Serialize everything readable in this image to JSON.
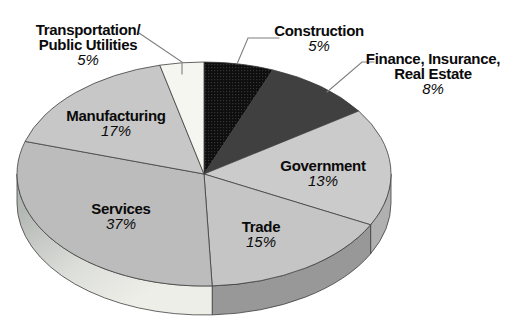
{
  "background_color": "#ffffff",
  "line_color": "#3f3f3f",
  "leader_color": "#7f7f7f",
  "text_color": "#0a0a0a",
  "chart_data": {
    "type": "pie",
    "style": "3d-ellipse",
    "unit": "%",
    "title": "",
    "legend": "none (direct slice labels, three with leader lines)",
    "direction": "clockwise",
    "start": "12-oclock",
    "categories": [
      "Construction",
      "Finance, Insurance, Real Estate",
      "Government",
      "Trade",
      "Services",
      "Manufacturing",
      "Transportation/Public Utilities"
    ],
    "values": [
      5,
      8,
      13,
      15,
      37,
      17,
      5
    ],
    "layout": {
      "cx": 204,
      "cy": 174,
      "rx": 187,
      "ry": 112,
      "depth": 29,
      "wall_visible_cum_range": [
        25,
        75
      ],
      "note_drawn_boundaries": "cumulative % positions of slice edges as drawn in source image"
    },
    "services_wall_gradient": {
      "x1": 30,
      "y1": 205,
      "x2": 110,
      "y2": 320,
      "stops": [
        [
          "0%",
          "#b4b8b4"
        ],
        [
          "55%",
          "#dcdeda"
        ],
        [
          "100%",
          "#eeeee8"
        ]
      ]
    },
    "construction_texture": {
      "base": "#0e0e0e",
      "dot": "#343434"
    },
    "slices": [
      {
        "id": "construction",
        "label": "Construction",
        "value": 5,
        "pct_label": "5%",
        "label_lines": [
          "Construction"
        ],
        "label_x": 319,
        "label_y": 23,
        "top_color": "pattern:construction",
        "side_color": "#8a8a8a",
        "drawn": [
          0,
          6.0
        ],
        "leader": [
          [
            279,
            38
          ],
          [
            248,
            38
          ],
          [
            237,
            64
          ]
        ]
      },
      {
        "id": "finance-insurance-real-estate",
        "label": "Finance, Insurance, Real Estate",
        "value": 8,
        "pct_label": "8%",
        "label_lines": [
          "Finance, Insurance,",
          "Real Estate"
        ],
        "label_x": 433,
        "label_y": 51,
        "top_color": "#404040",
        "side_color": "#2e2e2e",
        "drawn": [
          6.0,
          15.5
        ],
        "leader": [
          [
            374,
            62
          ],
          [
            362,
            62
          ],
          [
            327,
            92
          ]
        ]
      },
      {
        "id": "government",
        "label": "Government",
        "value": 13,
        "pct_label": "13%",
        "label_lines": [
          "Government"
        ],
        "label_x": 323,
        "label_y": 158,
        "top_color": "#cbcbcb",
        "side_color": "#b0b0b0",
        "drawn": [
          15.5,
          32.5
        ],
        "leader": null
      },
      {
        "id": "trade",
        "label": "Trade",
        "value": 15,
        "pct_label": "15%",
        "label_lines": [
          "Trade"
        ],
        "label_x": 261,
        "label_y": 219,
        "top_color": "#c5c5c5",
        "side_color": "#989898",
        "drawn": [
          32.5,
          49.3
        ],
        "leader": null
      },
      {
        "id": "services",
        "label": "Services",
        "value": 37,
        "pct_label": "37%",
        "label_lines": [
          "Services"
        ],
        "label_x": 121,
        "label_y": 201,
        "top_color": "#bcbcbc",
        "side_color": "gradient:services-wall",
        "drawn": [
          49.3,
          79.7
        ],
        "leader": null
      },
      {
        "id": "manufacturing",
        "label": "Manufacturing",
        "value": 17,
        "pct_label": "17%",
        "label_lines": [
          "Manufacturing"
        ],
        "label_x": 116,
        "label_y": 108,
        "top_color": "#c7c7c7",
        "side_color": "#a0a0a0",
        "drawn": [
          79.7,
          96.2
        ],
        "leader": null
      },
      {
        "id": "transportation-public-utilities",
        "label": "Transportation/Public Utilities",
        "value": 5,
        "pct_label": "5%",
        "label_lines": [
          "Transportation/",
          "Public Utilities"
        ],
        "label_x": 88,
        "label_y": 22,
        "top_color": "#f6f6f1",
        "side_color": "#d8d8d2",
        "drawn": [
          96.2,
          100
        ],
        "leader": [
          [
            139,
            33
          ],
          [
            182,
            62
          ],
          [
            182,
            74
          ]
        ]
      }
    ]
  }
}
